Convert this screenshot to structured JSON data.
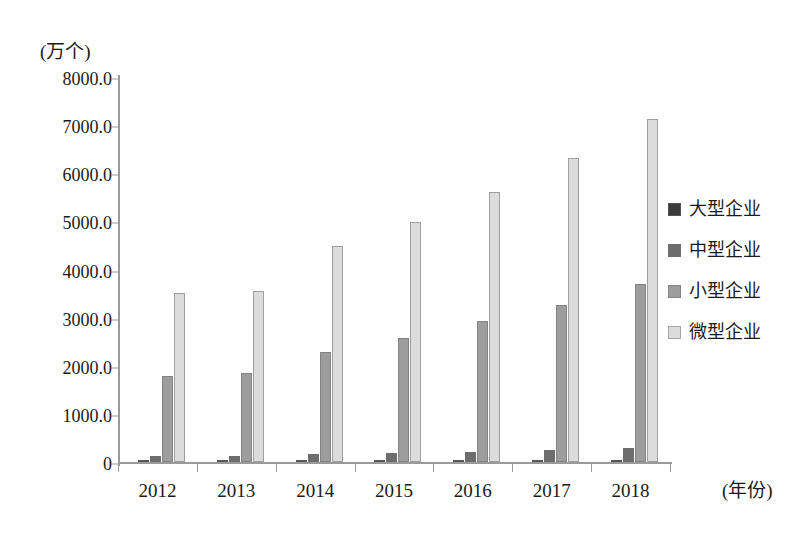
{
  "chart_data": {
    "type": "bar",
    "title": "",
    "subtitle": "",
    "unit_label": "(万个)",
    "xlabel": "(年份)",
    "ylabel": "",
    "categories": [
      "2012",
      "2013",
      "2014",
      "2015",
      "2016",
      "2017",
      "2018"
    ],
    "ylim": [
      0,
      8000
    ],
    "ytick_values": [
      0,
      1000,
      2000,
      3000,
      4000,
      5000,
      6000,
      7000,
      8000
    ],
    "ytick_labels": [
      "0",
      "1000.0",
      "2000.0",
      "3000.0",
      "4000.0",
      "5000.0",
      "6000.0",
      "7000.0",
      "8000.0"
    ],
    "grid": false,
    "legend_position": "right",
    "series": [
      {
        "name": "大型企业",
        "color": "#3b3b3b",
        "values": [
          15,
          17,
          19,
          21,
          24,
          27,
          31
        ]
      },
      {
        "name": "中型企业",
        "color": "#6d6d6d",
        "values": [
          120,
          130,
          165,
          185,
          215,
          250,
          300
        ]
      },
      {
        "name": "小型企业",
        "color": "#9d9d9d",
        "values": [
          1790,
          1850,
          2290,
          2580,
          2930,
          3270,
          3690
        ]
      },
      {
        "name": "微型企业",
        "color": "#dcdcdc",
        "values": [
          3520,
          3560,
          4480,
          4990,
          5610,
          6320,
          7120
        ]
      }
    ]
  },
  "legend": {
    "items": [
      {
        "label": "大型企业",
        "color": "#3b3b3b"
      },
      {
        "label": "中型企业",
        "color": "#6d6d6d"
      },
      {
        "label": "小型企业",
        "color": "#9d9d9d"
      },
      {
        "label": "微型企业",
        "color": "#dcdcdc"
      }
    ]
  }
}
